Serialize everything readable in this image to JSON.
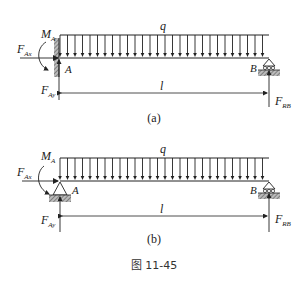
{
  "figure": {
    "caption": "图 11-45",
    "colors": {
      "ink": "#222222",
      "hatch": "#666666",
      "background": "#ffffff"
    }
  },
  "diagram_a": {
    "label": "(a)",
    "load_label": "q",
    "moment_label": "M",
    "moment_sub": "A",
    "fax_label": "F",
    "fax_sub": "Ax",
    "fay_label": "F",
    "fay_sub": "Ay",
    "frb_label": "F",
    "frb_sub": "RB",
    "point_a": "A",
    "point_b": "B",
    "length_label": "l",
    "support_a": "fixed-wall",
    "support_b": "roller"
  },
  "diagram_b": {
    "label": "(b)",
    "load_label": "q",
    "moment_label": "M",
    "moment_sub": "A",
    "fax_label": "F",
    "fax_sub": "Ax",
    "fay_label": "F",
    "fay_sub": "Ay",
    "frb_label": "F",
    "frb_sub": "RB",
    "point_a": "A",
    "point_b": "B",
    "length_label": "l",
    "support_a": "pin",
    "support_b": "roller"
  }
}
